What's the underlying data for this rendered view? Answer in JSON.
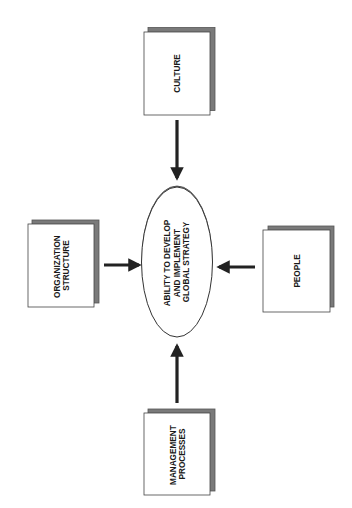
{
  "diagram": {
    "center": {
      "lines": [
        "ABILITY TO DEVELOP",
        "AND IMPLEMENT",
        "GLOBAL STRATEGY"
      ]
    },
    "nodes": {
      "culture": {
        "lines": [
          "CULTURE"
        ]
      },
      "organization_structure": {
        "lines": [
          "ORGANIZATION",
          "STRUCTURE"
        ]
      },
      "people": {
        "lines": [
          "PEOPLE"
        ]
      },
      "management_processes": {
        "lines": [
          "MANAGEMENT",
          "PROCESSES"
        ]
      }
    },
    "edges": [
      {
        "from": "culture",
        "to": "center"
      },
      {
        "from": "organization_structure",
        "to": "center"
      },
      {
        "from": "people",
        "to": "center"
      },
      {
        "from": "management_processes",
        "to": "center"
      }
    ],
    "colors": {
      "stroke": "#3a3a3a",
      "shadow": "#7a7a7a",
      "fill": "#ffffff",
      "arrow": "#222222"
    }
  }
}
